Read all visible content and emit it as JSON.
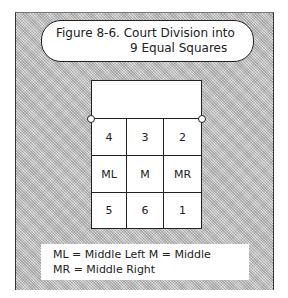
{
  "figure": {
    "title_line1": "Figure 8-6. Court Division into",
    "title_line2": "9 Equal Squares"
  },
  "court": {
    "cells": [
      [
        "4",
        "3",
        "2"
      ],
      [
        "ML",
        "M",
        "MR"
      ],
      [
        "5",
        "6",
        "1"
      ]
    ]
  },
  "legend": {
    "line1": "ML = Middle Left   M = Middle",
    "line2": "MR = Middle Right"
  },
  "colors": {
    "background_pattern": "#c8c8c8",
    "box_fill": "#ffffff",
    "line": "#222222"
  }
}
